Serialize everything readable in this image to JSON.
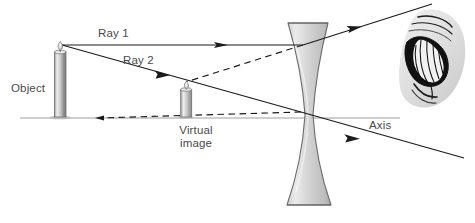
{
  "figure": {
    "type": "ray-diagram",
    "width": 475,
    "height": 223,
    "background_color": "#ffffff"
  },
  "labels": {
    "object": "Object",
    "ray1": "Ray 1",
    "ray2": "Ray 2",
    "virtual_image": "Virtual\nimage",
    "virtual_image_line1": "Virtual",
    "virtual_image_line2": "image",
    "axis": "Axis"
  },
  "colors": {
    "text": "#4a4a4a",
    "ray_line": "#1a1a1a",
    "axis_line": "#9a9a9a",
    "lens_fill_light": "#e6e6e6",
    "lens_fill_dark": "#b4b4b4",
    "lens_stroke": "#6e6e6e",
    "candle_body_light": "#f0f0f0",
    "candle_body_dark": "#8c8c8c",
    "flame_color": "#c8c8c8",
    "eye_skin": "#dcdcdc",
    "eye_dark": "#111111",
    "ground_shadow": "#b0b0b0"
  },
  "geometry": {
    "axis": {
      "x1": 20,
      "y1": 118,
      "x2": 400,
      "y2": 118
    },
    "object": {
      "base_x": 60,
      "base_y": 117,
      "body_top_y": 53,
      "body_width": 11,
      "flame_tip_x": 62,
      "flame_tip_y": 42
    },
    "virtual_image": {
      "base_x": 186,
      "base_y": 117,
      "body_top_y": 90,
      "body_width": 11,
      "flame_tip_x": 187,
      "flame_tip_y": 82
    },
    "lens": {
      "center_x": 308,
      "top_y": 23,
      "bottom_y": 205,
      "top_half_width": 20,
      "waist_half_width": 5,
      "waist_y": 115
    },
    "ray1": {
      "incident": {
        "x1": 62,
        "y1": 45,
        "x2": 302,
        "y2": 45
      },
      "refracted": {
        "x1": 302,
        "y1": 45,
        "x2": 430,
        "y2": 5
      },
      "arrow_positions": [
        [
          222,
          45
        ],
        [
          357,
          27
        ]
      ]
    },
    "ray2": {
      "incident": {
        "x1": 62,
        "y1": 45,
        "x2": 300,
        "y2": 112
      },
      "refracted": {
        "x1": 300,
        "y1": 112,
        "x2": 462,
        "y2": 158
      },
      "arrow_positions": [
        [
          163,
          73
        ],
        [
          352,
          137
        ]
      ]
    },
    "virtual_ray1_extension": {
      "x1": 302,
      "y1": 45,
      "x2": 187,
      "y2": 82
    },
    "virtual_ray2_extension": {
      "x1": 300,
      "y1": 112,
      "x2": 95,
      "y2": 118
    },
    "eye": {
      "x": 398,
      "y": 8,
      "width": 70,
      "height": 100
    }
  }
}
